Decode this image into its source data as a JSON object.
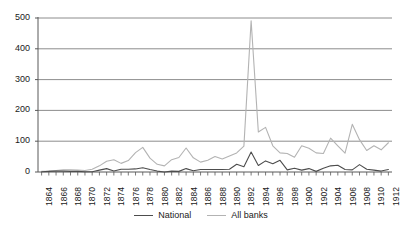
{
  "chart_data": {
    "type": "line",
    "title": "",
    "xlabel": "",
    "ylabel": "",
    "ylim": [
      0,
      500
    ],
    "yticks": [
      0,
      100,
      200,
      300,
      400,
      500
    ],
    "ytick_labels": [
      "0",
      "100",
      "200",
      "300",
      "400",
      "500"
    ],
    "grid": true,
    "legend_position": "bottom-center",
    "x": [
      1864,
      1865,
      1866,
      1867,
      1868,
      1869,
      1870,
      1871,
      1872,
      1873,
      1874,
      1875,
      1876,
      1877,
      1878,
      1879,
      1880,
      1881,
      1882,
      1883,
      1884,
      1885,
      1886,
      1887,
      1888,
      1889,
      1890,
      1891,
      1892,
      1893,
      1894,
      1895,
      1896,
      1897,
      1898,
      1899,
      1900,
      1901,
      1902,
      1903,
      1904,
      1905,
      1906,
      1907,
      1908,
      1909,
      1910,
      1911,
      1912
    ],
    "xtick_labels": [
      "1864",
      "1866",
      "1868",
      "1870",
      "1872",
      "1874",
      "1876",
      "1878",
      "1880",
      "1882",
      "1884",
      "1886",
      "1888",
      "1890",
      "1892",
      "1894",
      "1896",
      "1898",
      "1900",
      "1902",
      "1904",
      "1906",
      "1908",
      "1910",
      "1912"
    ],
    "xtick_step_years": 2,
    "series": [
      {
        "name": "National",
        "color": "#4d4d4d",
        "values": [
          1,
          2,
          3,
          3,
          2,
          2,
          1,
          1,
          6,
          11,
          3,
          9,
          9,
          10,
          14,
          8,
          3,
          0,
          3,
          2,
          11,
          4,
          8,
          8,
          8,
          8,
          9,
          25,
          17,
          65,
          21,
          36,
          27,
          38,
          7,
          12,
          6,
          11,
          2,
          12,
          20,
          22,
          8,
          7,
          24,
          9,
          6,
          3,
          8
        ]
      },
      {
        "name": "All banks",
        "color": "#b3b3b3",
        "values": [
          2,
          3,
          5,
          7,
          7,
          6,
          5,
          9,
          20,
          35,
          40,
          28,
          37,
          63,
          80,
          45,
          25,
          20,
          40,
          47,
          78,
          46,
          32,
          38,
          50,
          42,
          52,
          62,
          84,
          491,
          130,
          145,
          85,
          62,
          60,
          48,
          85,
          77,
          62,
          60,
          110,
          85,
          61,
          155,
          105,
          70,
          85,
          72,
          95
        ]
      }
    ],
    "annotations": {
      "peak_year": 1893,
      "peak_value": 491,
      "peak_series": "All banks"
    }
  },
  "legend": {
    "items": [
      {
        "label": "National",
        "color": "#4d4d4d"
      },
      {
        "label": "All banks",
        "color": "#b3b3b3"
      }
    ]
  },
  "colors": {
    "national": "#4d4d4d",
    "all_banks": "#b3b3b3",
    "gridline": "#808080",
    "axis": "#595959",
    "text": "#1a1a1a",
    "background": "#ffffff"
  }
}
